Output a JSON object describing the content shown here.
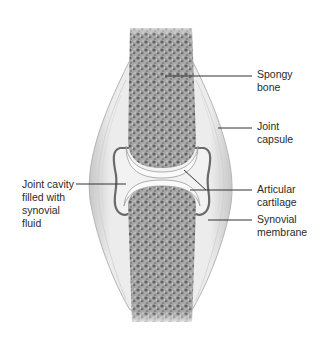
{
  "diagram": {
    "labels": [
      {
        "id": "spongy-bone",
        "text": "Spongy\nbone"
      },
      {
        "id": "joint-capsule",
        "text": "Joint\ncapsule"
      },
      {
        "id": "articular-cartilage",
        "text": "Articular\ncartilage"
      },
      {
        "id": "synovial-membrane",
        "text": "Synovial\nmembrane"
      },
      {
        "id": "joint-cavity",
        "text": "Joint cavity\nfilled with\nsynovial\nfluid"
      }
    ],
    "colors": {
      "bone_fill": "#9a9a9a",
      "bone_dark": "#5e5e5e",
      "capsule": "#e6e6e6",
      "capsule_edge": "#b5b5b5",
      "cavity": "#f0f0f0",
      "membrane": "#6a6a6a",
      "leader_line": "#333333",
      "text": "#2a2a2a"
    }
  }
}
